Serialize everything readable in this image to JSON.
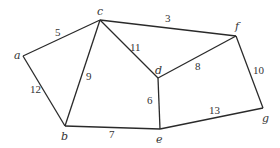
{
  "diagram": {
    "type": "weighted-undirected-graph",
    "nodes": [
      {
        "id": "a",
        "label": "a",
        "x": 23,
        "y": 56,
        "lx": 14,
        "ly": 59
      },
      {
        "id": "b",
        "label": "b",
        "x": 65,
        "y": 126,
        "lx": 61,
        "ly": 140
      },
      {
        "id": "c",
        "label": "c",
        "x": 100,
        "y": 20,
        "lx": 97,
        "ly": 15
      },
      {
        "id": "d",
        "label": "d",
        "x": 158,
        "y": 78,
        "lx": 155,
        "ly": 74
      },
      {
        "id": "e",
        "label": "e",
        "x": 160,
        "y": 129,
        "lx": 156,
        "ly": 143
      },
      {
        "id": "f",
        "label": "f",
        "x": 236,
        "y": 36,
        "lx": 235,
        "ly": 30
      },
      {
        "id": "g",
        "label": "g",
        "x": 263,
        "y": 108,
        "lx": 262,
        "ly": 122
      }
    ],
    "edges": [
      {
        "from": "a",
        "to": "c",
        "weight": "5",
        "lx": 55,
        "ly": 36
      },
      {
        "from": "a",
        "to": "b",
        "weight": "12",
        "lx": 30,
        "ly": 93
      },
      {
        "from": "c",
        "to": "b",
        "weight": "9",
        "lx": 86,
        "ly": 80
      },
      {
        "from": "c",
        "to": "f",
        "weight": "3",
        "lx": 165,
        "ly": 22
      },
      {
        "from": "c",
        "to": "d",
        "weight": "11",
        "lx": 130,
        "ly": 51
      },
      {
        "from": "d",
        "to": "f",
        "weight": "8",
        "lx": 195,
        "ly": 70
      },
      {
        "from": "d",
        "to": "e",
        "weight": "6",
        "lx": 147,
        "ly": 104
      },
      {
        "from": "b",
        "to": "e",
        "weight": "7",
        "lx": 109,
        "ly": 138
      },
      {
        "from": "e",
        "to": "g",
        "weight": "13",
        "lx": 209,
        "ly": 114
      },
      {
        "from": "f",
        "to": "g",
        "weight": "10",
        "lx": 253,
        "ly": 74
      }
    ]
  }
}
